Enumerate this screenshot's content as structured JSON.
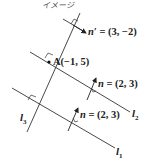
{
  "title": "イメージ",
  "point_a": {
    "label": "A(−1, 5)"
  },
  "normal_vectors": [
    {
      "symbol": "n′",
      "value": "= (3, −2)"
    },
    {
      "symbol": "n",
      "value": "= (2, 3)"
    },
    {
      "symbol": "n",
      "value": "= (2, 3)"
    }
  ],
  "lines": [
    {
      "name": "l",
      "sub": "3"
    },
    {
      "name": "l",
      "sub": "2"
    },
    {
      "name": "l",
      "sub": "1"
    }
  ],
  "colors": {
    "line": "#333333",
    "text": "#222222"
  }
}
